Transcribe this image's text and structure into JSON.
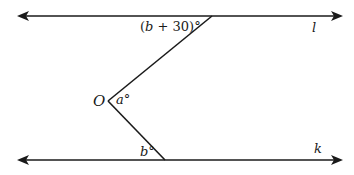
{
  "diagram": {
    "type": "geometry-parallel-lines",
    "lines": [
      {
        "name": "l",
        "label": "l"
      },
      {
        "name": "k",
        "label": "k"
      }
    ],
    "point": {
      "label": "O"
    },
    "angles": {
      "top": {
        "var": "b",
        "text_pre": "(",
        "text_var": "b",
        "text_post": " + 30)°"
      },
      "middle": {
        "var": "a",
        "text_var": "a",
        "text_post": "°"
      },
      "bottom": {
        "var": "b",
        "text_var": "b",
        "text_post": "°"
      }
    },
    "stroke_color": "#1a1a1a",
    "background": "#ffffff"
  }
}
